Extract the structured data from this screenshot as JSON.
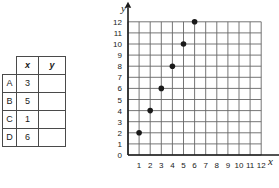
{
  "table": {
    "corner_label": "",
    "headers": [
      "x",
      "y"
    ],
    "rows": [
      {
        "label": "A",
        "x": "3",
        "y": ""
      },
      {
        "label": "B",
        "x": "5",
        "y": ""
      },
      {
        "label": "C",
        "x": "1",
        "y": ""
      },
      {
        "label": "D",
        "x": "6",
        "y": ""
      }
    ]
  },
  "chart_data": {
    "type": "scatter",
    "title": "",
    "xlabel": "x",
    "ylabel": "y",
    "xlim": [
      0,
      12
    ],
    "ylim": [
      0,
      12
    ],
    "grid": true,
    "legend": "none",
    "x_ticks": [
      "1",
      "2",
      "3",
      "4",
      "5",
      "6",
      "7",
      "8",
      "9",
      "10",
      "11",
      "12"
    ],
    "y_ticks": [
      "0",
      "1",
      "2",
      "3",
      "4",
      "5",
      "6",
      "7",
      "8",
      "9",
      "10",
      "11",
      "12"
    ],
    "origin_label": "0",
    "points": [
      {
        "x": 1,
        "y": 2
      },
      {
        "x": 2,
        "y": 4
      },
      {
        "x": 3,
        "y": 6
      },
      {
        "x": 4,
        "y": 8
      },
      {
        "x": 5,
        "y": 10
      },
      {
        "x": 6,
        "y": 12
      }
    ],
    "point_color": "#1a1a1a",
    "grid_color": "#666666",
    "axis_color": "#1a1a1a"
  }
}
